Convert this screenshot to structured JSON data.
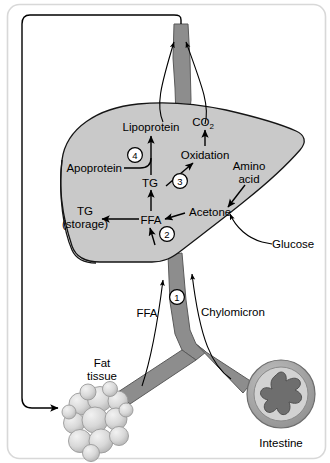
{
  "figure": {
    "frame_color": "#d8d8d8",
    "background_color": "#ffffff"
  },
  "colors": {
    "liver_fill": "#c9c9c9",
    "liver_outline": "#151515",
    "vessel_fill": "#8d8d8d",
    "vessel_outline": "#5a5a5a",
    "intestine_ring_outer": "#a8a8a8",
    "intestine_ring_inner": "#d2d2d2",
    "intestine_lumen": "#6e6e6e",
    "fat_cell_fill": "#d5d5d5",
    "fat_cell_outline": "#9a9a9a",
    "arrow_color": "#000000",
    "text_color": "#000000"
  },
  "organs": [
    {
      "id": "liver",
      "name": "liver",
      "label": ""
    },
    {
      "id": "intestine",
      "name": "intestine",
      "label": "Intestine"
    },
    {
      "id": "fat-tissue",
      "name": "fat-tissue",
      "label": "Fat\ntissue"
    },
    {
      "id": "blood-vessel",
      "name": "blood-vessel",
      "label": ""
    }
  ],
  "labels": {
    "lipoprotein": "Lipoprotein",
    "co2": "CO",
    "co2_sub": "2",
    "oxidation": "Oxidation",
    "apoprotein": "Apoprotein",
    "tg": "TG",
    "tg_storage_line1": "TG",
    "tg_storage_line2": "(storage)",
    "ffa_liver": "FFA",
    "acetone": "Acetone",
    "amino_acid_line1": "Amino",
    "amino_acid_line2": "acid",
    "glucose": "Glucose",
    "ffa_vessel": "FFA",
    "chylomicron": "Chylomicron",
    "fat_tissue_line1": "Fat",
    "fat_tissue_line2": "tissue",
    "intestine": "Intestine"
  },
  "step_markers": [
    {
      "id": "step-1",
      "number": "1",
      "meaning": "Chylomicron / FFA uptake into liver via portal circulation"
    },
    {
      "id": "step-2",
      "number": "2",
      "meaning": "FFA entering liver from blood"
    },
    {
      "id": "step-3",
      "number": "3",
      "meaning": "TG to oxidation"
    },
    {
      "id": "step-4",
      "number": "4",
      "meaning": "Apoprotein + TG to lipoprotein"
    }
  ],
  "arrows": [
    {
      "id": "arrow-ffa-to-tg-storage",
      "from": "FFA",
      "to": "TG (storage)"
    },
    {
      "id": "arrow-acetone-to-ffa",
      "from": "Acetone",
      "to": "FFA"
    },
    {
      "id": "arrow-ffa-to-tg",
      "from": "FFA",
      "to": "TG"
    },
    {
      "id": "arrow-tg-to-oxidation",
      "from": "TG",
      "to": "Oxidation"
    },
    {
      "id": "arrow-oxidation-to-co2",
      "from": "Oxidation",
      "to": "CO2"
    },
    {
      "id": "arrow-apoprotein-to-lipoprotein",
      "from": "Apoprotein",
      "to": "Lipoprotein"
    },
    {
      "id": "arrow-tg-to-lipoprotein",
      "from": "TG",
      "to": "Lipoprotein"
    },
    {
      "id": "arrow-amino-acid-into-liver",
      "from": "Amino acid",
      "to": "liver"
    },
    {
      "id": "arrow-glucose-into-liver",
      "from": "Glucose",
      "to": "liver"
    },
    {
      "id": "arrow-vessel-ffa-up",
      "from": "Fat tissue FFA",
      "to": "liver"
    },
    {
      "id": "arrow-vessel-chylomicron-up",
      "from": "Intestine chylomicron",
      "to": "liver"
    },
    {
      "id": "arrow-liver-to-circulation-left",
      "from": "Lipoprotein",
      "to": "systemic circulation"
    },
    {
      "id": "arrow-liver-to-circulation-right",
      "from": "CO2",
      "to": "systemic circulation"
    },
    {
      "id": "arrow-circulation-to-fat",
      "from": "systemic circulation",
      "to": "Fat tissue"
    }
  ]
}
